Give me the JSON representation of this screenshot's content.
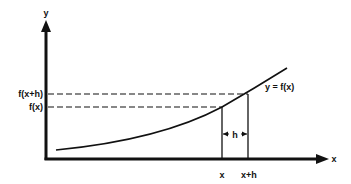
{
  "diagram": {
    "axes": {
      "y_label": "y",
      "x_label": "x"
    },
    "curve": {
      "label": "y = f(x)"
    },
    "y_markers": [
      {
        "label": "f(x+h)"
      },
      {
        "label": "f(x)"
      }
    ],
    "x_markers": [
      {
        "label": "x"
      },
      {
        "label": "x+h"
      }
    ],
    "interval": {
      "label": "h"
    },
    "colors": {
      "ink": "#111111",
      "background": "#ffffff"
    }
  }
}
